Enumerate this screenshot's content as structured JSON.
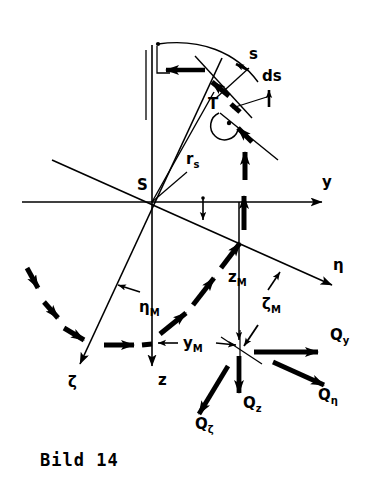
{
  "figure": {
    "caption": "Bild 14",
    "line_color": "#000000",
    "background_color": "#ffffff",
    "description_kind": "engineering-vector-diagram"
  },
  "points": [
    {
      "name": "S",
      "label": "S",
      "x": 152,
      "y": 202,
      "role": "origin-shear-center"
    },
    {
      "name": "T",
      "label": "T",
      "x": 214,
      "y": 104,
      "role": "curve-point"
    },
    {
      "name": "M",
      "label": "",
      "x": 240,
      "y": 352,
      "role": "force-application-point"
    }
  ],
  "axes": [
    {
      "name": "y-axis",
      "label": "y",
      "label_x": 344,
      "label_y": 182,
      "from_x": 22,
      "from_y": 202,
      "to_x": 330,
      "to_y": 202,
      "arrow": true
    },
    {
      "name": "z-axis",
      "label": "z",
      "label_x": 159,
      "label_y": 381,
      "from_x": 152,
      "from_y": 45,
      "to_x": 152,
      "to_y": 374,
      "arrow": true
    },
    {
      "name": "eta-axis",
      "label": "η",
      "label_x": 355,
      "label_y": 268,
      "from_x": 52,
      "from_y": 160,
      "to_x": 338,
      "to_y": 288,
      "arrow": true
    },
    {
      "name": "zeta-axis",
      "label": "ζ",
      "label_x": 73,
      "label_y": 383,
      "from_x": 222,
      "from_y": 58,
      "to_x": 76,
      "to_y": 373,
      "arrow": true
    }
  ],
  "annotations": [
    {
      "name": "arc-length-s",
      "label": "s",
      "label_x": 253,
      "label_y": 57,
      "kind": "tangent-length"
    },
    {
      "name": "differential-ds",
      "label": "ds",
      "label_x": 267,
      "label_y": 79,
      "kind": "differential-element"
    },
    {
      "name": "radius-rs",
      "label": "r",
      "sub": "s",
      "label_x": 191,
      "label_y": 161,
      "kind": "radius-vector"
    },
    {
      "name": "coordinate-eta-M",
      "label": "η",
      "sub": "M",
      "label_x": 145,
      "label_y": 312,
      "kind": "coordinate-offset"
    },
    {
      "name": "coordinate-zeta-M",
      "label": "ζ",
      "sub": "M",
      "label_x": 266,
      "label_y": 308,
      "kind": "coordinate-offset"
    },
    {
      "name": "coordinate-y-M",
      "label": "y",
      "sub": "M",
      "label_x": 188,
      "label_y": 348,
      "kind": "coordinate-offset"
    },
    {
      "name": "coordinate-z-M",
      "label": "z",
      "sub": "M",
      "label_x": 233,
      "label_y": 281,
      "kind": "coordinate-offset"
    }
  ],
  "forces": [
    {
      "name": "force-Qy",
      "label": "Q",
      "sub": "y",
      "label_x": 337,
      "label_y": 338,
      "from_x": 254,
      "from_y": 352,
      "to_x": 327,
      "to_y": 352,
      "direction": "right"
    },
    {
      "name": "force-Qeta",
      "label": "Q",
      "sub": "η",
      "label_x": 325,
      "label_y": 398,
      "from_x": 273,
      "from_y": 362,
      "to_x": 331,
      "to_y": 388,
      "direction": "down-right"
    },
    {
      "name": "force-Qz",
      "label": "Q",
      "sub": "z",
      "label_x": 248,
      "label_y": 407,
      "from_x": 239,
      "from_y": 356,
      "to_x": 239,
      "to_y": 400,
      "direction": "down"
    },
    {
      "name": "force-Qzeta",
      "label": "Q",
      "sub": "ζ",
      "label_x": 200,
      "label_y": 427,
      "from_x": 227,
      "from_y": 365,
      "to_x": 195,
      "to_y": 419,
      "direction": "down-left"
    }
  ],
  "curves": [
    {
      "name": "profile-trajectory",
      "kind": "dashed-arrow-chain",
      "style": "thick-segmented-arrows"
    },
    {
      "name": "upper-arc",
      "kind": "thin-arc"
    },
    {
      "name": "tangent-line",
      "kind": "thin-straight"
    }
  ],
  "markers": [
    {
      "name": "right-angle-marker",
      "x": 228,
      "y": 126,
      "kind": "angle-arc-with-dot"
    }
  ]
}
